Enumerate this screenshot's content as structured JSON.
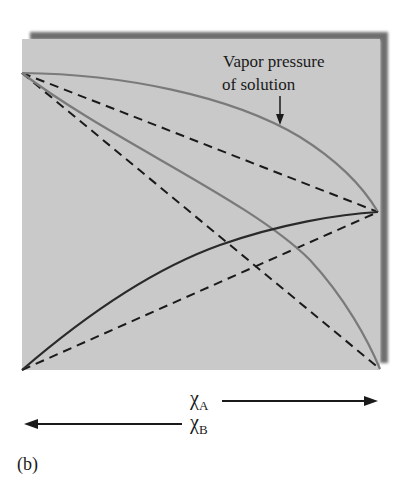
{
  "figure": {
    "panel_label": "(b)",
    "annotation": {
      "line1": "Vapor pressure",
      "line2": "of solution"
    },
    "axis": {
      "xA_symbol": "χ",
      "xA_sub": "A",
      "xB_symbol": "χ",
      "xB_sub": "B"
    },
    "colors": {
      "background": "#ffffff",
      "panel_fill": "#c9c9c9",
      "panel_shadow": "#6e6e6e",
      "total_curve": "#7a7a7a",
      "component_b_curve": "#7a7a7a",
      "component_a_curve": "#2a2a2a",
      "ideal_dashed": "#1a1a1a"
    }
  },
  "diagram": {
    "type": "vapor-pressure-composition (positive deviation from Raoult's law)",
    "panel": {
      "x": 22,
      "y": 39,
      "width": 358,
      "height": 331
    },
    "lines": [
      {
        "name": "vapor-pressure-of-solution",
        "style": "solid-gray",
        "from": [
          22,
          73
        ],
        "to": [
          378,
          212
        ],
        "bows": "up"
      },
      {
        "name": "component-b-partial-pressure",
        "style": "solid-gray",
        "from": [
          22,
          73
        ],
        "to": [
          380,
          369
        ],
        "bows": "up"
      },
      {
        "name": "component-a-partial-pressure",
        "style": "solid-dark",
        "from": [
          22,
          370
        ],
        "to": [
          378,
          212
        ],
        "bows": "up"
      },
      {
        "name": "ideal-total",
        "style": "dashed",
        "from": [
          22,
          73
        ],
        "to": [
          378,
          212
        ]
      },
      {
        "name": "ideal-b",
        "style": "dashed",
        "from": [
          22,
          73
        ],
        "to": [
          380,
          369
        ]
      },
      {
        "name": "ideal-a",
        "style": "dashed",
        "from": [
          22,
          370
        ],
        "to": [
          378,
          212
        ]
      }
    ],
    "arrows": [
      {
        "label": "χA",
        "direction": "right"
      },
      {
        "label": "χB",
        "direction": "left"
      }
    ]
  }
}
